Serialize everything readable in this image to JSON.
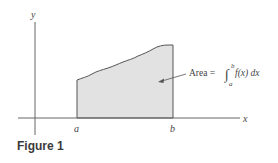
{
  "figure": {
    "caption": "Figure 1",
    "axes": {
      "x_label": "x",
      "y_label": "y"
    },
    "ticks": {
      "a_label": "a",
      "b_label": "b"
    },
    "annotation": {
      "prefix": "Area = ",
      "integral_sign": "∫",
      "upper_limit": "b",
      "lower_limit": "a",
      "integrand": "f(x) dx"
    },
    "colors": {
      "fill": "#e2e2e2",
      "stroke": "#555555",
      "axis": "#666666",
      "text": "#444444"
    }
  }
}
